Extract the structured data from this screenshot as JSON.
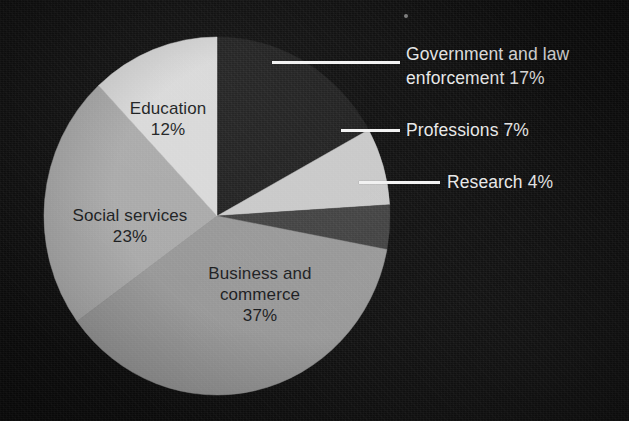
{
  "chart_data": {
    "type": "pie",
    "title": "",
    "legend_position": "callout-right",
    "categories": [
      "Government and law enforcement",
      "Professions",
      "Research",
      "Business and commerce",
      "Social services",
      "Education"
    ],
    "values": [
      17,
      7,
      4,
      37,
      23,
      12
    ],
    "unit": "%",
    "total": 100,
    "colors": [
      "#1e1e1e",
      "#c8c8c8",
      "#3f3f3f",
      "#969696",
      "#a8a8a8",
      "#d8d8d8"
    ],
    "start_angle_deg": 0,
    "direction": "clockwise"
  },
  "slices": {
    "government": {
      "name": "Government and law enforcement",
      "value": 17,
      "label_line1": "Government and law",
      "label_line2": "enforcement 17%",
      "color": "#1e1e1e",
      "placement": "callout"
    },
    "professions": {
      "name": "Professions",
      "value": 7,
      "label_line1": "Professions 7%",
      "color": "#c8c8c8",
      "placement": "callout"
    },
    "research": {
      "name": "Research",
      "value": 4,
      "label_line1": "Research 4%",
      "color": "#3f3f3f",
      "placement": "callout"
    },
    "business": {
      "name": "Business and commerce",
      "value": 37,
      "label_line1": "Business and",
      "label_line2": "commerce",
      "label_line3": "37%",
      "color": "#969696",
      "placement": "inside"
    },
    "social": {
      "name": "Social services",
      "value": 23,
      "label_line1": "Social services",
      "label_line2": "23%",
      "color": "#a8a8a8",
      "placement": "inside"
    },
    "education": {
      "name": "Education",
      "value": 12,
      "label_line1": "Education",
      "label_line2": "12%",
      "color": "#d8d8d8",
      "placement": "inside"
    }
  },
  "style": {
    "background": "#0d0d0d",
    "callout_text_color": "#e8e8e8",
    "inside_text_color": "#16181a",
    "leader_color": "#f2f2f2"
  }
}
